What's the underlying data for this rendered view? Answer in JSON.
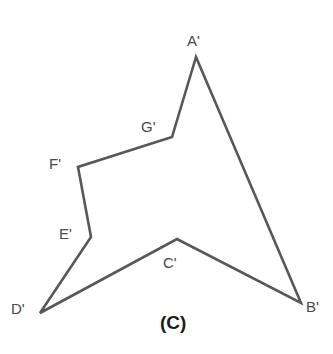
{
  "figure": {
    "caption": "(C)",
    "caption_position": {
      "x": 160,
      "y": 313
    },
    "stroke_color": "#585858",
    "stroke_width": 2.6,
    "fill_color": "#ffffff",
    "label_color": "#4a4a4a",
    "background_color": "#ffffff",
    "shape_type": "concave-polygon-7-vertices",
    "vertices": [
      {
        "id": "A",
        "label": "A'",
        "x": 196,
        "y": 57,
        "label_x": 187,
        "label_y": 33,
        "kind": "convex-apex"
      },
      {
        "id": "B",
        "label": "B'",
        "x": 301,
        "y": 303,
        "label_x": 306,
        "label_y": 299,
        "kind": "convex"
      },
      {
        "id": "C",
        "label": "C'",
        "x": 177,
        "y": 239,
        "label_x": 163,
        "label_y": 255,
        "kind": "concave"
      },
      {
        "id": "D",
        "label": "D'",
        "x": 40,
        "y": 313,
        "label_x": 11,
        "label_y": 301,
        "kind": "convex"
      },
      {
        "id": "E",
        "label": "E'",
        "x": 91,
        "y": 237,
        "label_x": 59,
        "label_y": 226,
        "kind": "concave"
      },
      {
        "id": "F",
        "label": "F'",
        "x": 78,
        "y": 167,
        "label_x": 49,
        "label_y": 156,
        "kind": "convex"
      },
      {
        "id": "G",
        "label": "G'",
        "x": 172,
        "y": 137,
        "label_x": 141,
        "label_y": 119,
        "kind": "concave"
      }
    ],
    "edges": [
      {
        "from": "A",
        "to": "B"
      },
      {
        "from": "B",
        "to": "C"
      },
      {
        "from": "C",
        "to": "D"
      },
      {
        "from": "D",
        "to": "E"
      },
      {
        "from": "E",
        "to": "F"
      },
      {
        "from": "F",
        "to": "G"
      },
      {
        "from": "G",
        "to": "A"
      }
    ],
    "path_d": "M 196 57 L 301 303 L 177 239 L 40 313 L 91 237 L 78 167 L 172 137 Z"
  }
}
